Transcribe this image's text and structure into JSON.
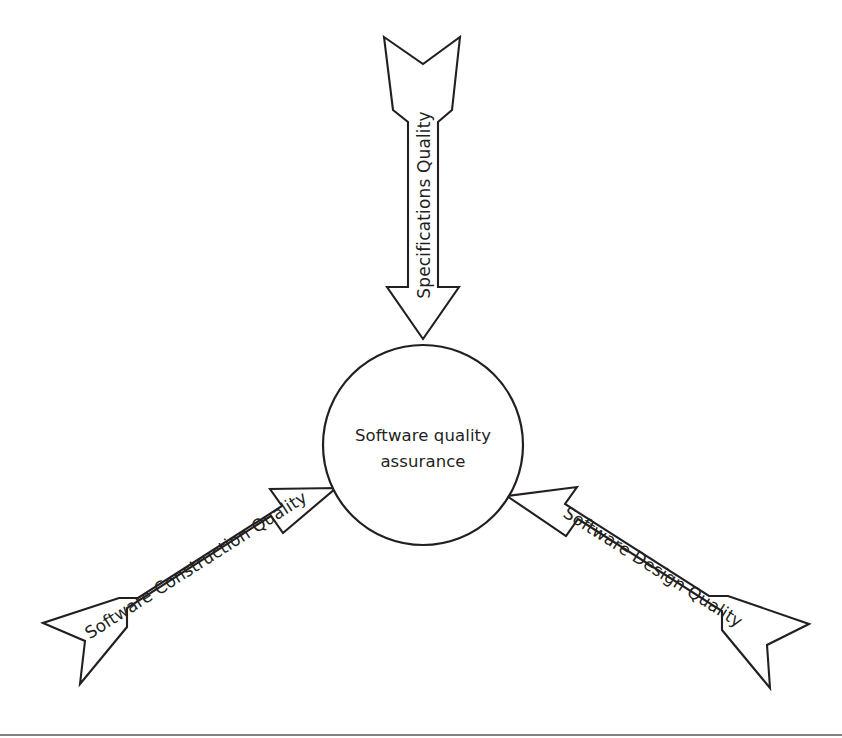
{
  "diagram": {
    "type": "hub-and-spoke-arrow-diagram",
    "hub": {
      "name": "software-quality-assurance",
      "label_line_1": "Software quality",
      "label_line_2": "assurance",
      "shape": "circle",
      "center_x": 423,
      "center_y": 445,
      "radius": 100,
      "fill_color": "#ffffff",
      "stroke_color": "#231f20"
    },
    "arrows": [
      {
        "id": "specifications-quality",
        "label": "Specifications Quality",
        "direction": "top-to-center",
        "points_at": "software-quality-assurance",
        "text_rotation_deg": -90,
        "fill_color": "#ffffff",
        "stroke_color": "#231f20"
      },
      {
        "id": "software-construction-quality",
        "label": "Software Construction Quality",
        "direction": "bottom-left-to-center",
        "points_at": "software-quality-assurance",
        "text_rotation_deg": -28,
        "fill_color": "#ffffff",
        "stroke_color": "#231f20"
      },
      {
        "id": "software-design-quality",
        "label": "Software Design Quality",
        "direction": "bottom-right-to-center",
        "points_at": "software-quality-assurance",
        "text_rotation_deg": 28,
        "fill_color": "#ffffff",
        "stroke_color": "#231f20"
      }
    ],
    "footer_rule": {
      "visible": true,
      "color": "#58585b"
    },
    "background_color": "#ffffff"
  }
}
